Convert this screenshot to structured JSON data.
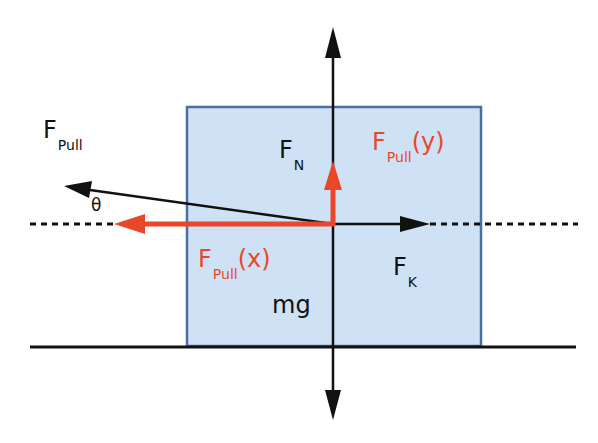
{
  "diagram": {
    "colors": {
      "box_fill": "#cfe2f5",
      "box_border": "#4a6fa5",
      "red_component": "#e8472a",
      "black": "#111111"
    },
    "labels": {
      "fpull": {
        "main": "F",
        "sub": "Pull"
      },
      "theta": "θ",
      "fn": {
        "main": "F",
        "sub": "N"
      },
      "fpull_y": {
        "main": "F",
        "sub": "Pull",
        "suffix": "(y)"
      },
      "fpull_x": {
        "main": "F",
        "sub": "Pull",
        "suffix": "(x)"
      },
      "fk": {
        "main": "F",
        "sub": "K"
      },
      "mg": "mg"
    },
    "vectors": [
      {
        "name": "F_pull",
        "color": "black",
        "direction": "up-left at angle θ"
      },
      {
        "name": "F_pull(x)",
        "color": "red",
        "direction": "left"
      },
      {
        "name": "F_pull(y)",
        "color": "red",
        "direction": "up"
      },
      {
        "name": "F_N",
        "color": "black",
        "direction": "up"
      },
      {
        "name": "mg",
        "color": "black",
        "direction": "down"
      },
      {
        "name": "F_K",
        "color": "black",
        "direction": "right"
      }
    ]
  }
}
